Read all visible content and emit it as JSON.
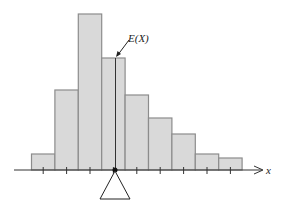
{
  "chart_data": {
    "type": "bar",
    "title": "",
    "xlabel": "x",
    "ylabel": "",
    "categories": [
      "1",
      "2",
      "3",
      "4",
      "5",
      "6",
      "7",
      "8",
      "9"
    ],
    "values": [
      16,
      80,
      156,
      112,
      75,
      52,
      36,
      16,
      12
    ],
    "grid": false,
    "legend": null,
    "annotations": [
      {
        "text": "E(X)",
        "target": "mean line",
        "position": "between bar 4 center"
      }
    ],
    "mean_marker": {
      "label": "E(X)",
      "x_position": 4.05
    },
    "fulcrum": "triangle",
    "bar_fill": "#d9d9d9",
    "bar_stroke": "#8c8c8c"
  },
  "labels": {
    "mean": "E(X)",
    "axis": "x"
  }
}
